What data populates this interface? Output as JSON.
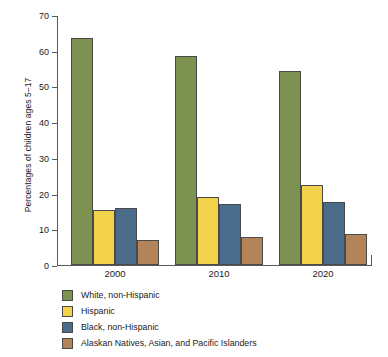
{
  "chart_data": {
    "type": "bar",
    "title": "",
    "xlabel": "",
    "ylabel": "Percentages of children ages 5–17",
    "categories": [
      "2000",
      "2010",
      "2020"
    ],
    "ylim": [
      0,
      70
    ],
    "yticks": [
      0,
      10,
      20,
      30,
      40,
      50,
      60,
      70
    ],
    "ytick_labels": [
      "0",
      "10",
      "20",
      "30",
      "40",
      "50",
      "60",
      "70"
    ],
    "grid": false,
    "legend_position": "below-left",
    "series": [
      {
        "name": "White, non-Hispanic",
        "color": "#7d9150",
        "values": [
          63.5,
          58.5,
          54.2
        ]
      },
      {
        "name": "Hispanic",
        "color": "#f2d14b",
        "values": [
          15.4,
          19.0,
          22.4
        ]
      },
      {
        "name": "Black, non-Hispanic",
        "color": "#4a6b8a",
        "values": [
          16.0,
          17.1,
          17.6
        ]
      },
      {
        "name": "Alaskan Natives, Asian, and Pacific Islanders",
        "color": "#b3835a",
        "values": [
          7.0,
          7.8,
          8.7
        ]
      }
    ]
  }
}
